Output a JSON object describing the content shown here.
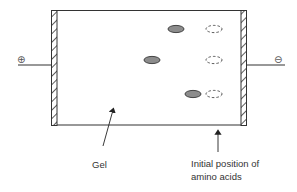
{
  "diagram": {
    "type": "gel-electrophoresis",
    "anode": {
      "symbol": "⊕",
      "side": "left"
    },
    "cathode": {
      "symbol": "⊖",
      "side": "right"
    },
    "labels": {
      "gel": "Gel",
      "initial_position_line1": "Initial position of",
      "initial_position_line2": "amino acids"
    },
    "lanes": [
      {
        "lane": 1,
        "final_spot": {
          "x": 176,
          "y": 29
        },
        "initial_spot": {
          "x": 214,
          "y": 29
        }
      },
      {
        "lane": 2,
        "final_spot": {
          "x": 152,
          "y": 60
        },
        "initial_spot": {
          "x": 214,
          "y": 60
        }
      },
      {
        "lane": 3,
        "final_spot": {
          "x": 193,
          "y": 94
        },
        "initial_spot": {
          "x": 214,
          "y": 94
        }
      }
    ],
    "colors": {
      "line": "#333333",
      "spot_fill": "#8c8c8c",
      "background": "#ffffff"
    }
  }
}
